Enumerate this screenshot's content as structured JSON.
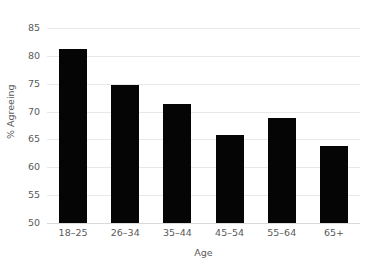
{
  "chart_data": {
    "type": "bar",
    "title": "",
    "subtitle": "",
    "xlabel": "Age",
    "ylabel": "% Agreeing",
    "categories": [
      "18–25",
      "26–34",
      "35–44",
      "45–54",
      "55–64",
      "65+"
    ],
    "values": [
      81.3,
      74.7,
      71.3,
      65.8,
      68.8,
      63.8
    ],
    "series": [
      {
        "name": "% Agreeing",
        "values": [
          81.3,
          74.7,
          71.3,
          65.8,
          68.8,
          63.8
        ]
      }
    ],
    "ylim": [
      50,
      85
    ],
    "yticks": [
      50,
      55,
      60,
      65,
      70,
      75,
      80,
      85
    ],
    "ytick_labels": [
      "50",
      "55",
      "60",
      "65",
      "70",
      "75",
      "80",
      "85"
    ],
    "xlim_categories": 6,
    "grid": true,
    "grid_axis": "y",
    "legend": false,
    "legend_position": "none",
    "bar_color": "#050505",
    "grid_color": "#e8e8ea",
    "text_color": "#5a5a5a",
    "background": "#ffffff",
    "annotations": []
  }
}
